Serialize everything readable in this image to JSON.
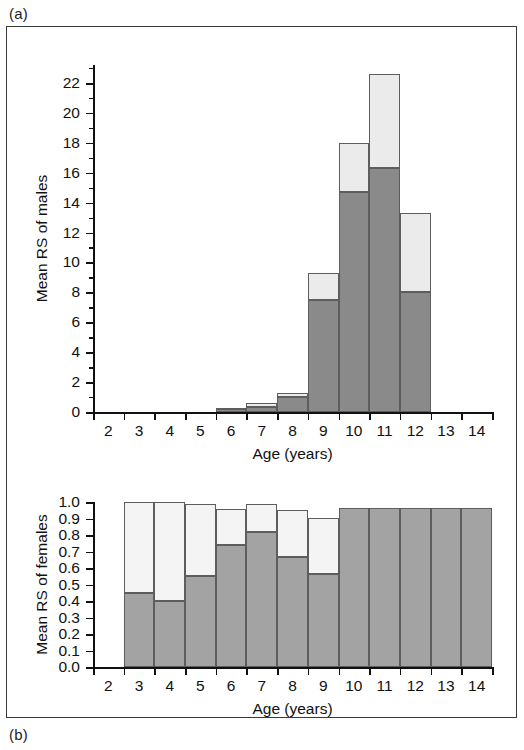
{
  "figure": {
    "panel_a_label": "(a)",
    "panel_b_label": "(b)"
  },
  "chart_data": [
    {
      "panel": "(a)",
      "type": "bar",
      "stacked": true,
      "title": "",
      "xlabel": "Age (years)",
      "ylabel": "Mean RS of males",
      "categories": [
        "2",
        "3",
        "4",
        "5",
        "6",
        "7",
        "8",
        "9",
        "10",
        "11",
        "12",
        "13",
        "14"
      ],
      "xlim": [
        1.5,
        14.5
      ],
      "ylim": [
        0,
        23.2
      ],
      "yticks": [
        "0",
        "2",
        "4",
        "6",
        "8",
        "10",
        "12",
        "14",
        "16",
        "18",
        "20",
        "22"
      ],
      "ytick_values": [
        0,
        2,
        4,
        6,
        8,
        10,
        12,
        14,
        16,
        18,
        20,
        22
      ],
      "xticks": [
        "2",
        "3",
        "4",
        "5",
        "6",
        "7",
        "8",
        "9",
        "10",
        "11",
        "12",
        "13",
        "14"
      ],
      "grid": false,
      "legend": "none",
      "series": [
        {
          "name": "lower segment",
          "color": "#8a8a8a",
          "values": [
            0,
            0,
            0,
            0,
            0.2,
            0.35,
            1.0,
            7.5,
            14.7,
            16.3,
            8.0,
            0,
            0
          ]
        },
        {
          "name": "upper segment",
          "color": "#ebebeb",
          "values": [
            0,
            0,
            0,
            0,
            0.1,
            0.25,
            0.3,
            1.8,
            3.3,
            6.3,
            5.3,
            0,
            0
          ]
        }
      ],
      "totals": [
        0,
        0,
        0,
        0,
        0.3,
        0.6,
        1.3,
        9.3,
        18.0,
        22.6,
        13.3,
        0,
        0
      ]
    },
    {
      "panel": "(b)",
      "type": "bar",
      "stacked": true,
      "title": "",
      "xlabel": "Age (years)",
      "ylabel": "Mean RS of females",
      "categories": [
        "2",
        "3",
        "4",
        "5",
        "6",
        "7",
        "8",
        "9",
        "10",
        "11",
        "12",
        "13",
        "14"
      ],
      "xlim": [
        1.5,
        14.5
      ],
      "ylim": [
        0,
        1.0
      ],
      "yticks": [
        "0.0",
        "0.1",
        "0.2",
        "0.3",
        "0.4",
        "0.5",
        "0.6",
        "0.7",
        "0.8",
        "0.9",
        "1.0"
      ],
      "ytick_values": [
        0.0,
        0.1,
        0.2,
        0.3,
        0.4,
        0.5,
        0.6,
        0.7,
        0.8,
        0.9,
        1.0
      ],
      "xticks": [
        "2",
        "3",
        "4",
        "5",
        "6",
        "7",
        "8",
        "9",
        "10",
        "11",
        "12",
        "13",
        "14"
      ],
      "grid": false,
      "legend": "none",
      "series": [
        {
          "name": "lower segment",
          "color": "#a3a3a3",
          "values": [
            0,
            0.45,
            0.4,
            0.55,
            0.74,
            0.82,
            0.665,
            0.565,
            0.965,
            0.965,
            0.965,
            0.965,
            0.965
          ]
        },
        {
          "name": "upper segment",
          "color": "#f4f4f4",
          "values": [
            0,
            0.55,
            0.6,
            0.44,
            0.22,
            0.17,
            0.285,
            0.34,
            0,
            0,
            0,
            0
          ]
        }
      ],
      "totals": [
        0,
        1.0,
        1.0,
        0.99,
        0.96,
        0.99,
        0.95,
        0.905,
        0.965,
        0.965,
        0.965,
        0.965,
        0.965
      ]
    }
  ]
}
